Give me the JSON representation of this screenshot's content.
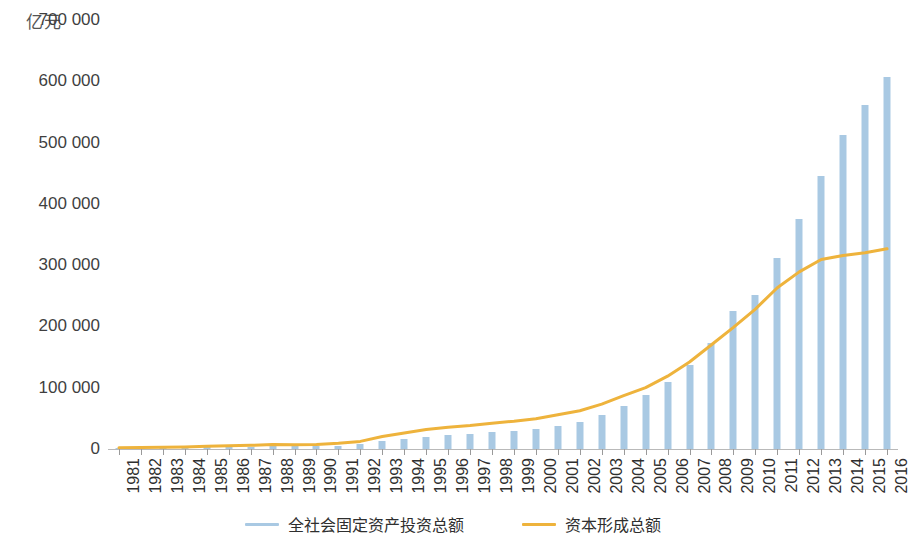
{
  "chart_data": {
    "type": "bar",
    "title": "",
    "subtitle": "",
    "unit_label": "亿元",
    "xlabel": "",
    "ylabel": "亿元",
    "ylim": [
      0,
      700000
    ],
    "ytick_labels": [
      "700 000",
      "600 000",
      "500 000",
      "400 000",
      "300 000",
      "200 000",
      "100 000",
      "0"
    ],
    "ytick_values": [
      700000,
      600000,
      500000,
      400000,
      300000,
      200000,
      100000,
      0
    ],
    "grid": false,
    "legend_position": "bottom",
    "categories": [
      "1981",
      "1982",
      "1983",
      "1984",
      "1985",
      "1986",
      "1987",
      "1988",
      "1989",
      "1990",
      "1991",
      "1992",
      "1993",
      "1994",
      "1995",
      "1996",
      "1997",
      "1998",
      "1999",
      "2000",
      "2001",
      "2002",
      "2003",
      "2004",
      "2005",
      "2006",
      "2007",
      "2008",
      "2009",
      "2010",
      "2011",
      "2012",
      "2013",
      "2014",
      "2015",
      "2016"
    ],
    "series": [
      {
        "name": "全社会固定资产投资总额",
        "type": "bar",
        "color": "#a9c9e3",
        "values": [
          961,
          1230,
          1430,
          1833,
          2543,
          3121,
          3792,
          4754,
          4410,
          4517,
          5595,
          8080,
          13072,
          17042,
          20019,
          22914,
          24941,
          28406,
          29855,
          32918,
          37214,
          43500,
          55567,
          70477,
          88774,
          109998,
          137324,
          172828,
          224599,
          251684,
          311485,
          374695,
          446294,
          512021,
          562000,
          606466
        ]
      },
      {
        "name": "资本形成总额",
        "type": "line",
        "color": "#eeb33c",
        "values": [
          2014,
          2344,
          2652,
          3455,
          4591,
          5220,
          5970,
          7306,
          7138,
          7517,
          9204,
          12422,
          20341,
          26261,
          31855,
          35565,
          38360,
          42198,
          45352,
          49364,
          55963,
          62436,
          73163,
          87157,
          100212,
          118856,
          141903,
          170024,
          198499,
          228311,
          263058,
          288993,
          309240,
          315862,
          320200,
          326620
        ]
      }
    ]
  },
  "legend": {
    "items": [
      {
        "label": "全社会固定资产投资总额",
        "color": "#a9c9e3"
      },
      {
        "label": "资本形成总额",
        "color": "#eeb33c"
      }
    ]
  }
}
